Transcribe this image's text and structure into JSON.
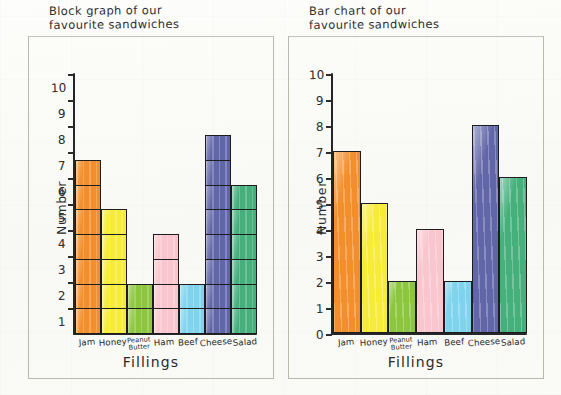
{
  "page": {
    "background_color": "#fbfbf8",
    "ink_color": "#262628"
  },
  "chart_data": [
    {
      "type": "bar",
      "variant": "block-graph",
      "title": "Block graph of our\nfavourite sandwiches",
      "xlabel": "Fillings",
      "ylabel": "Number",
      "categories": [
        "Jam",
        "Honey",
        "Peanut\nButter",
        "Ham",
        "Beef",
        "Cheese",
        "Salad"
      ],
      "values": [
        7,
        5,
        2,
        4,
        2,
        8,
        6
      ],
      "colors": [
        "#F28E2B",
        "#F7EB3A",
        "#8CC63E",
        "#F9C6CE",
        "#7FD3ED",
        "#6166A8",
        "#45B07C"
      ],
      "ylim": [
        0,
        10
      ],
      "ytick_labels": [
        "10",
        "9",
        "8",
        "7",
        "6",
        "5",
        "4",
        "3",
        "2",
        "1"
      ],
      "ytick_alignment": "centered-in-block",
      "grid": false,
      "legend": "none"
    },
    {
      "type": "bar",
      "variant": "bar-chart",
      "title": "Bar chart of our\nfavourite sandwiches",
      "xlabel": "Fillings",
      "ylabel": "Number",
      "categories": [
        "Jam",
        "Honey",
        "Peanut\nButter",
        "Ham",
        "Beef",
        "Cheese",
        "Salad"
      ],
      "values": [
        7,
        5,
        2,
        4,
        2,
        8,
        6
      ],
      "colors": [
        "#F28E2B",
        "#F7EB3A",
        "#8CC63E",
        "#F9C6CE",
        "#7FD3ED",
        "#6166A8",
        "#45B07C"
      ],
      "ylim": [
        0,
        10
      ],
      "ytick_labels": [
        "10",
        "9",
        "8",
        "7",
        "6",
        "5",
        "4",
        "3",
        "2",
        "1",
        "0"
      ],
      "ytick_alignment": "on-tick",
      "grid": false,
      "legend": "none"
    }
  ]
}
